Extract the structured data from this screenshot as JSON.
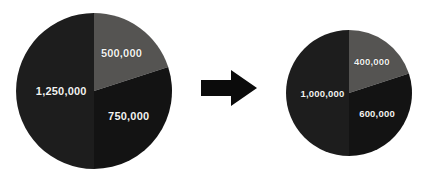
{
  "figure": {
    "background_color": "#ffffff",
    "arrow_icon": "right-arrow-icon",
    "arrow_color": "#0b0b0b"
  },
  "chart_data": [
    {
      "type": "pie",
      "name": "before-pie-chart",
      "title": "",
      "categories": [
        "500,000",
        "750,000",
        "1,250,000"
      ],
      "values": [
        500000,
        750000,
        1250000
      ],
      "labels": [
        "500,000",
        "750,000",
        "1,250,000"
      ],
      "total": 2500000,
      "angles_deg": [
        72,
        108,
        180
      ],
      "colors": [
        "#555452",
        "#131313",
        "#1d1d1d"
      ],
      "label_color": "#f2f2f0",
      "start_angle_deg": 270,
      "direction": "clockwise",
      "legend": "none",
      "grid": false,
      "center": {
        "x": 94,
        "y": 91
      },
      "radius": 78
    },
    {
      "type": "pie",
      "name": "after-pie-chart",
      "title": "",
      "categories": [
        "400,000",
        "600,000",
        "1,000,000"
      ],
      "values": [
        400000,
        600000,
        1000000
      ],
      "labels": [
        "400,000",
        "600,000",
        "1,000,000"
      ],
      "total": 2000000,
      "angles_deg": [
        72,
        108,
        180
      ],
      "colors": [
        "#555452",
        "#131313",
        "#1d1d1d"
      ],
      "label_color": "#f2f2f0",
      "start_angle_deg": 270,
      "direction": "clockwise",
      "legend": "none",
      "grid": false,
      "center": {
        "x": 349,
        "y": 93
      },
      "radius": 63
    }
  ],
  "left_chart": {
    "slice_gray_label": "500,000",
    "slice_dark_label": "750,000",
    "slice_bottom_label": "1,250,000"
  },
  "right_chart": {
    "slice_gray_label": "400,000",
    "slice_dark_label": "600,000",
    "slice_bottom_label": "1,000,000"
  }
}
